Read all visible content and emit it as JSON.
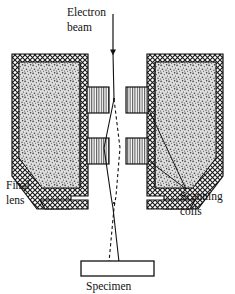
{
  "figure": {
    "background_color": "#ffffff",
    "line_color": "#111111"
  },
  "labels": {
    "electron_beam_line1": "Electron",
    "electron_beam_line2": "beam",
    "final_lens_line1": "Final",
    "final_lens_line2": "lens",
    "scanning_coils_line1": "Scanning",
    "scanning_coils_line2": "coils",
    "specimen": "Specimen"
  },
  "parts": {
    "lens_shell_pattern": "cross-hatch",
    "lens_core_pattern": "stipple",
    "coil_pattern": "vertical-hatch",
    "beam_path_style": "solid",
    "deflected_path_style": "dashed",
    "arrow_direction": "down",
    "coil_count": 4,
    "specimen_fill": "#ffffff"
  },
  "colors": {
    "ink": "#111111",
    "shell_fill": "#ffffff",
    "core_fill": "#b9b9b9",
    "coil_fill": "#ffffff"
  }
}
